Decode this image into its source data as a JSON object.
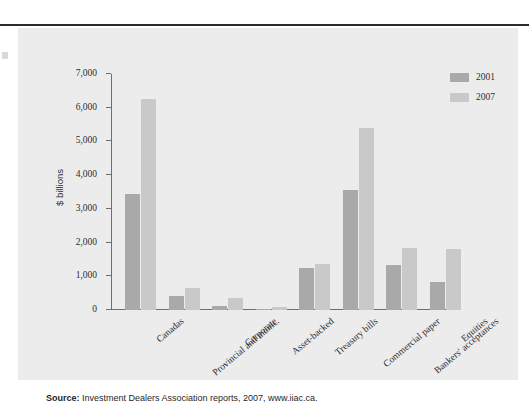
{
  "figure": {
    "source_label": "Source:",
    "source_text": " Investment Dealers Association reports, 2007, www.iiac.ca."
  },
  "chart_data": {
    "type": "bar",
    "title": "",
    "xlabel": "",
    "ylabel": "$ billions",
    "ylim": [
      0,
      7000
    ],
    "ytick_labels": [
      "0",
      "1,000",
      "2,000",
      "3,000",
      "4,000",
      "5,000",
      "6,000",
      "7,000"
    ],
    "ytick_values": [
      0,
      1000,
      2000,
      3000,
      4000,
      5000,
      6000,
      7000
    ],
    "grid": false,
    "legend_position": "top-right",
    "categories": [
      "Canadas",
      "Provincial and munic.",
      "Corporate",
      "Asset-backed",
      "Treasury bills",
      "Commercial paper",
      "Bankers' acceptances",
      "Equities"
    ],
    "series": [
      {
        "name": "2001",
        "color": "#a9a9aa",
        "values": [
          3450,
          420,
          130,
          20,
          1260,
          3570,
          1340,
          830
        ]
      },
      {
        "name": "2007",
        "color": "#c9c9ca",
        "values": [
          6250,
          640,
          360,
          90,
          1370,
          5400,
          1830,
          1820
        ]
      }
    ]
  }
}
